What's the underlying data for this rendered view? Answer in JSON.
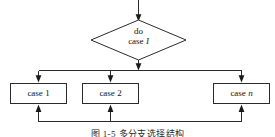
{
  "figure": {
    "caption": "图 1-5    多分支选择结构",
    "background_color": "#ffffff",
    "line_color": "#2b2b2b",
    "text_color": "#141414"
  },
  "decision": {
    "shape": "diamond",
    "line1": "do",
    "line2_prefix": "case ",
    "line2_var": "I"
  },
  "branches": [
    {
      "label_prefix": "case ",
      "label_var": "1",
      "var_italic": false
    },
    {
      "label_prefix": "case ",
      "label_var": "2",
      "var_italic": false
    },
    {
      "label_prefix": "case ",
      "label_var": "n",
      "var_italic": true
    }
  ],
  "connectors": {
    "entry_arrow": "arrow-down-into-decision",
    "exit_arrow": "arrow-down-from-decision",
    "distribution_bus": "horizontal-split-bus",
    "merge_bus": "horizontal-merge-bus"
  }
}
